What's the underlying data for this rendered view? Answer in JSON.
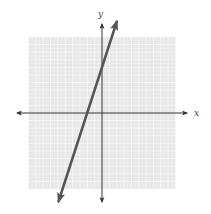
{
  "chart_data": {
    "type": "line",
    "title": "",
    "xlabel": "x",
    "ylabel": "y",
    "xlim": [
      -10,
      10
    ],
    "ylim": [
      -10,
      10
    ],
    "grid": true,
    "grid_minor_step": 0.5,
    "grid_major_step": 1,
    "tick_labels": false,
    "series": [
      {
        "name": "line",
        "equation": "y = 3x + 6",
        "slope": 3,
        "y_intercept": 6,
        "x_intercept": -2,
        "arrows_both_ends": true,
        "points": [
          [
            -5.9,
            -11.6
          ],
          [
            2,
            12
          ]
        ]
      }
    ]
  },
  "colors": {
    "grid_bg": "#e6e6e6",
    "grid_line": "#f7f7f7",
    "axis": "#333333",
    "series_line": "#555555"
  },
  "labels": {
    "x_axis": "x",
    "y_axis": "y"
  }
}
